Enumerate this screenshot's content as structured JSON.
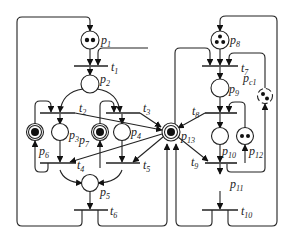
{
  "diagram": {
    "type": "petri-net",
    "places": [
      {
        "id": "p1",
        "label": "p",
        "sub": "1",
        "tokens": 2
      },
      {
        "id": "p2",
        "label": "p",
        "sub": "2",
        "tokens": 0
      },
      {
        "id": "p3",
        "label": "p",
        "sub": "3",
        "tokens": 0
      },
      {
        "id": "p4",
        "label": "p",
        "sub": "4",
        "tokens": 0
      },
      {
        "id": "p5",
        "label": "p",
        "sub": "5",
        "tokens": 0
      },
      {
        "id": "p6",
        "label": "p",
        "sub": "6",
        "tokens": 1
      },
      {
        "id": "p7",
        "label": "p",
        "sub": "7",
        "tokens": 1
      },
      {
        "id": "p8",
        "label": "p",
        "sub": "8",
        "tokens": 3
      },
      {
        "id": "p9",
        "label": "p",
        "sub": "9",
        "tokens": 0
      },
      {
        "id": "p10",
        "label": "p",
        "sub": "10",
        "tokens": 0
      },
      {
        "id": "p11",
        "label": "p",
        "sub": "11",
        "tokens": 0
      },
      {
        "id": "p12",
        "label": "p",
        "sub": "12",
        "tokens": 2
      },
      {
        "id": "p13",
        "label": "p",
        "sub": "13",
        "tokens": 1
      },
      {
        "id": "pc1",
        "label": "p",
        "sub": "c1",
        "tokens": 2
      }
    ],
    "transitions": [
      {
        "id": "t1",
        "label": "t",
        "sub": "1"
      },
      {
        "id": "t2",
        "label": "t",
        "sub": "2"
      },
      {
        "id": "t3",
        "label": "t",
        "sub": "3"
      },
      {
        "id": "t4",
        "label": "t",
        "sub": "4"
      },
      {
        "id": "t5",
        "label": "t",
        "sub": "5"
      },
      {
        "id": "t6",
        "label": "t",
        "sub": "6"
      },
      {
        "id": "t7",
        "label": "t",
        "sub": "7"
      },
      {
        "id": "t8",
        "label": "t",
        "sub": "8"
      },
      {
        "id": "t9",
        "label": "t",
        "sub": "9"
      },
      {
        "id": "t10",
        "label": "t",
        "sub": "10"
      }
    ]
  }
}
